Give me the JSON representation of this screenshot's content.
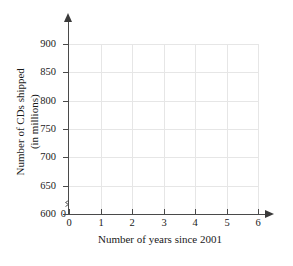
{
  "chart_data": {
    "type": "scatter",
    "title": "",
    "xlabel": "Number of years since 2001",
    "ylabel_line1": "Number of CDs shipped",
    "ylabel_line2": "(in millions)",
    "x_ticks": [
      "0",
      "1",
      "2",
      "3",
      "4",
      "5",
      "6"
    ],
    "x_values": [
      0,
      1,
      2,
      3,
      4,
      5,
      6
    ],
    "y_ticks": [
      "600",
      "650",
      "700",
      "750",
      "800",
      "850",
      "900"
    ],
    "y_values": [
      600,
      650,
      700,
      750,
      800,
      850,
      900
    ],
    "y_origin_label": "0",
    "xlim": [
      0,
      6
    ],
    "ylim": [
      600,
      900
    ],
    "y_axis_broken": true,
    "grid": true,
    "legend": "none",
    "series": [],
    "data_points": [],
    "colors": {
      "grid": "#e6e6e6",
      "axis": "#4a4a4a",
      "text": "#1a1a1a",
      "background": "#ffffff"
    }
  }
}
